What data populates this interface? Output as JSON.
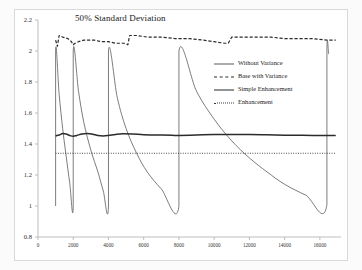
{
  "chart_data": {
    "type": "line",
    "title": "50% Standard Deviation",
    "xlabel": "",
    "ylabel": "",
    "xlim": [
      0,
      17200
    ],
    "ylim": [
      0.8,
      2.2
    ],
    "grid": false,
    "legend_position": "inside-top-right",
    "xticks": [
      0,
      2000,
      4000,
      6000,
      8000,
      10000,
      12000,
      14000,
      16000
    ],
    "xtick_labels": [
      "0",
      "2000",
      "4000",
      "6000",
      "8000",
      "10000",
      "12000",
      "14000",
      "16000"
    ],
    "yticks": [
      0.8,
      1,
      1.2,
      1.4,
      1.6,
      1.8,
      2,
      2.2
    ],
    "ytick_labels": [
      "0.8",
      "1",
      "1.2",
      "1.4",
      "1.6",
      "1.8",
      "2",
      "2.2"
    ],
    "series": [
      {
        "name": "Without Variance",
        "style": "solid-thin",
        "color": "#5a5a5a",
        "description": "Sawtooth: resets to 2.0 then decays exponentially to 1.0 over doubling periods",
        "resets_x": [
          1000,
          2000,
          4000,
          8000,
          16400
        ],
        "peak_value": 2.0,
        "trough_value": 1.0,
        "points": [
          [
            1000,
            1.0
          ],
          [
            1000,
            2.0
          ],
          [
            1200,
            1.72
          ],
          [
            1400,
            1.5
          ],
          [
            1600,
            1.32
          ],
          [
            1800,
            1.15
          ],
          [
            2000,
            1.0
          ],
          [
            2000,
            2.0
          ],
          [
            2300,
            1.74
          ],
          [
            2600,
            1.54
          ],
          [
            3000,
            1.36
          ],
          [
            3400,
            1.22
          ],
          [
            3700,
            1.1
          ],
          [
            4000,
            1.0
          ],
          [
            4000,
            2.0
          ],
          [
            4500,
            1.7
          ],
          [
            5000,
            1.5
          ],
          [
            5600,
            1.34
          ],
          [
            6200,
            1.22
          ],
          [
            7000,
            1.11
          ],
          [
            8000,
            1.0
          ],
          [
            8000,
            2.0
          ],
          [
            9000,
            1.74
          ],
          [
            10000,
            1.56
          ],
          [
            11000,
            1.42
          ],
          [
            12000,
            1.31
          ],
          [
            13000,
            1.22
          ],
          [
            14000,
            1.14
          ],
          [
            15200,
            1.07
          ],
          [
            16400,
            1.01
          ],
          [
            16400,
            2.0
          ],
          [
            16500,
            1.98
          ]
        ]
      },
      {
        "name": "Base with Variance",
        "style": "dashed",
        "color": "#2b2b2b",
        "description": "Noisy level near 2.05-2.10 with small step increases",
        "points": [
          [
            1000,
            2.07
          ],
          [
            1100,
            2.03
          ],
          [
            1200,
            2.1
          ],
          [
            1400,
            2.09
          ],
          [
            1700,
            2.08
          ],
          [
            1900,
            2.06
          ],
          [
            2000,
            2.04
          ],
          [
            2100,
            2.05
          ],
          [
            2300,
            2.06
          ],
          [
            2600,
            2.07
          ],
          [
            2900,
            2.07
          ],
          [
            3200,
            2.07
          ],
          [
            3600,
            2.06
          ],
          [
            4000,
            2.06
          ],
          [
            4400,
            2.05
          ],
          [
            4900,
            2.05
          ],
          [
            5100,
            2.04
          ],
          [
            5200,
            2.1
          ],
          [
            5600,
            2.1
          ],
          [
            6200,
            2.09
          ],
          [
            7000,
            2.09
          ],
          [
            7800,
            2.08
          ],
          [
            8600,
            2.08
          ],
          [
            9400,
            2.07
          ],
          [
            10000,
            2.06
          ],
          [
            10600,
            2.05
          ],
          [
            10800,
            2.05
          ],
          [
            11000,
            2.09
          ],
          [
            11600,
            2.09
          ],
          [
            12400,
            2.09
          ],
          [
            13200,
            2.09
          ],
          [
            14000,
            2.08
          ],
          [
            14800,
            2.08
          ],
          [
            15600,
            2.08
          ],
          [
            16400,
            2.07
          ],
          [
            16900,
            2.07
          ]
        ]
      },
      {
        "name": "Simple Enhancement",
        "style": "solid-thick",
        "color": "#2b2b2b",
        "description": "Near-constant around 1.455 with small damped ripples",
        "points": [
          [
            1000,
            1.452
          ],
          [
            1200,
            1.458
          ],
          [
            1400,
            1.468
          ],
          [
            1600,
            1.464
          ],
          [
            1800,
            1.455
          ],
          [
            2000,
            1.45
          ],
          [
            2200,
            1.455
          ],
          [
            2500,
            1.465
          ],
          [
            2800,
            1.468
          ],
          [
            3100,
            1.463
          ],
          [
            3400,
            1.455
          ],
          [
            3700,
            1.452
          ],
          [
            4000,
            1.455
          ],
          [
            4400,
            1.462
          ],
          [
            4800,
            1.466
          ],
          [
            5400,
            1.464
          ],
          [
            6000,
            1.46
          ],
          [
            6800,
            1.458
          ],
          [
            7600,
            1.456
          ],
          [
            8000,
            1.455
          ],
          [
            9000,
            1.458
          ],
          [
            10000,
            1.461
          ],
          [
            11000,
            1.462
          ],
          [
            12000,
            1.461
          ],
          [
            13000,
            1.459
          ],
          [
            14000,
            1.457
          ],
          [
            15000,
            1.456
          ],
          [
            16400,
            1.455
          ],
          [
            16900,
            1.455
          ]
        ]
      },
      {
        "name": "Enhancement",
        "style": "dotted",
        "color": "#3a3a3a",
        "description": "Flat horizontal line",
        "points": [
          [
            1000,
            1.34
          ],
          [
            16900,
            1.34
          ]
        ]
      }
    ]
  },
  "legend": {
    "items": [
      {
        "label": "Without Variance",
        "style": "solid-thin"
      },
      {
        "label": "Base with Variance",
        "style": "dashed"
      },
      {
        "label": "Simple Enhancement",
        "style": "solid-thick"
      },
      {
        "label": "Enhancement",
        "style": "dotted"
      }
    ]
  }
}
